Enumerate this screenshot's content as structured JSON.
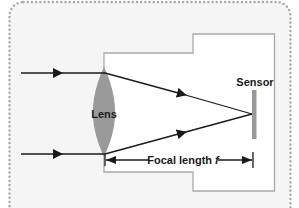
{
  "diagram": {
    "type": "camera-lens-optics",
    "labels": {
      "lens": "Lens",
      "sensor": "Sensor",
      "focal_length_text": "Focal length ",
      "focal_length_symbol": "f"
    },
    "colors": {
      "panel_background": "#f5f5f5",
      "panel_border": "#a8a8a8",
      "camera_body_fill": "#ffffff",
      "camera_body_stroke": "#a9a9a9",
      "lens_fill": "#9a9a9a",
      "sensor_fill": "#9a9a9a",
      "ray_color": "#1a1a1a"
    },
    "rays": [
      {
        "name": "top-incoming-ray"
      },
      {
        "name": "bottom-incoming-ray"
      },
      {
        "name": "top-converging-ray"
      },
      {
        "name": "bottom-converging-ray"
      }
    ]
  }
}
